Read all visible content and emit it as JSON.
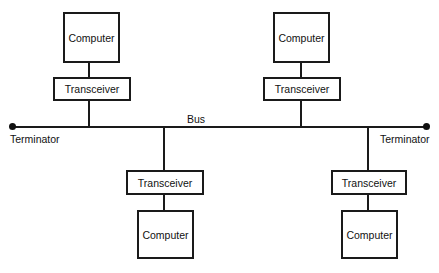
{
  "diagram": {
    "type": "bus network topology",
    "bus": {
      "label": "Bus"
    },
    "terminators": [
      {
        "label": "Terminator",
        "position": "left"
      },
      {
        "label": "Terminator",
        "position": "right"
      }
    ],
    "nodes": [
      {
        "computer": "Computer",
        "transceiver": "Transceiver",
        "side": "top-left"
      },
      {
        "computer": "Computer",
        "transceiver": "Transceiver",
        "side": "top-right"
      },
      {
        "computer": "Computer",
        "transceiver": "Transceiver",
        "side": "bottom-left"
      },
      {
        "computer": "Computer",
        "transceiver": "Transceiver",
        "side": "bottom-right"
      }
    ],
    "colors": {
      "stroke": "#1a1a1a",
      "background": "#ffffff"
    }
  }
}
